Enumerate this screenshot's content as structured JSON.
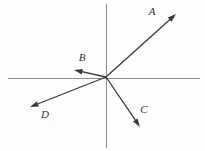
{
  "figure": {
    "width": 205,
    "height": 151,
    "background_color": "#fefefe",
    "axis_color": "#8e8e8e",
    "vector_color": "#3a3a3a",
    "label_color": "#2e2e2e"
  },
  "chart_data": {
    "type": "scatter",
    "title": "",
    "subtitle": "",
    "xlabel": "",
    "ylabel": "",
    "grid": false,
    "legend": "none",
    "axes": {
      "origin": {
        "x": 106,
        "y": 77
      },
      "x_axis": {
        "x1": 8,
        "y1": 78,
        "x2": 200,
        "y2": 78,
        "label": "",
        "ticks": []
      },
      "y_axis": {
        "x1": 106,
        "y1": 4,
        "x2": 106,
        "y2": 148,
        "label": "",
        "ticks": []
      },
      "xlim": [
        -98,
        94
      ],
      "ylim": [
        -71,
        73
      ]
    },
    "series": [
      {
        "name": "A",
        "label": "A",
        "tail_px": {
          "x": 106,
          "y": 77
        },
        "tip_px": {
          "x": 176,
          "y": 14
        },
        "components": {
          "x": 70,
          "y": 63
        },
        "label_px": {
          "x": 152,
          "y": 12
        },
        "quadrant": "I"
      },
      {
        "name": "B",
        "label": "B",
        "tail_px": {
          "x": 106,
          "y": 77
        },
        "tip_px": {
          "x": 74,
          "y": 70
        },
        "components": {
          "x": -32,
          "y": 7
        },
        "label_px": {
          "x": 82,
          "y": 58
        },
        "quadrant": "II"
      },
      {
        "name": "C",
        "label": "C",
        "tail_px": {
          "x": 106,
          "y": 77
        },
        "tip_px": {
          "x": 140,
          "y": 127
        },
        "components": {
          "x": 34,
          "y": -50
        },
        "label_px": {
          "x": 144,
          "y": 110
        },
        "quadrant": "IV"
      },
      {
        "name": "D",
        "label": "D",
        "tail_px": {
          "x": 106,
          "y": 77
        },
        "tip_px": {
          "x": 30,
          "y": 107
        },
        "components": {
          "x": -76,
          "y": -30
        },
        "label_px": {
          "x": 45,
          "y": 115
        },
        "quadrant": "III"
      }
    ]
  }
}
